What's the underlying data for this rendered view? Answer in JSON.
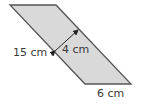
{
  "diagram": {
    "shape": "parallelogram",
    "fill_color": "#d9d9d9",
    "stroke_color": "#555555",
    "labels": {
      "side": "15 cm",
      "height": "4 cm",
      "base": "6 cm"
    }
  }
}
